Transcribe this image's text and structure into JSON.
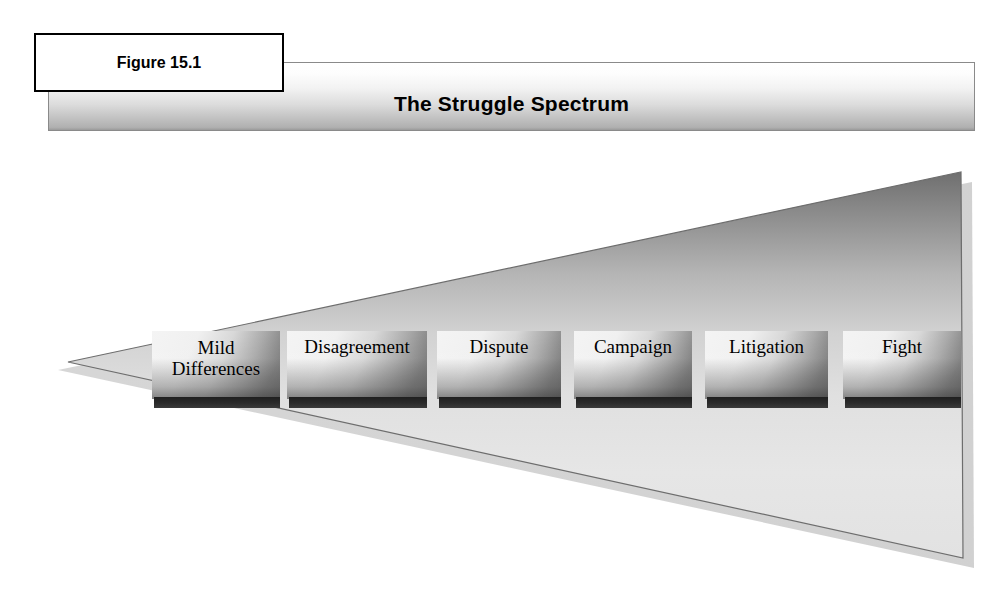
{
  "figure": {
    "label": "Figure 15.1"
  },
  "banner": {
    "title": "The Struggle Spectrum"
  },
  "diagram": {
    "type": "wedge-spectrum",
    "direction": "escalating left to right",
    "apex": "Mild Differences",
    "base": "Fight",
    "stages": [
      {
        "label": "Mild\nDifferences",
        "order": 1,
        "x": 152,
        "width": 128
      },
      {
        "label": "Disagreement",
        "order": 2,
        "x": 287,
        "width": 140
      },
      {
        "label": "Dispute",
        "order": 3,
        "x": 437,
        "width": 124
      },
      {
        "label": "Campaign",
        "order": 4,
        "x": 574,
        "width": 118
      },
      {
        "label": "Litigation",
        "order": 5,
        "x": 705,
        "width": 123
      },
      {
        "label": "Fight",
        "order": 6,
        "x": 843,
        "width": 118
      }
    ]
  },
  "colors": {
    "banner_top": "#ffffff",
    "banner_bottom": "#9a9a9a",
    "wedge_dark": "#7a7a7a",
    "wedge_light": "#e8e8e8",
    "box_bar": "#222222",
    "outline": "#6f6f6f",
    "text": "#000000"
  }
}
